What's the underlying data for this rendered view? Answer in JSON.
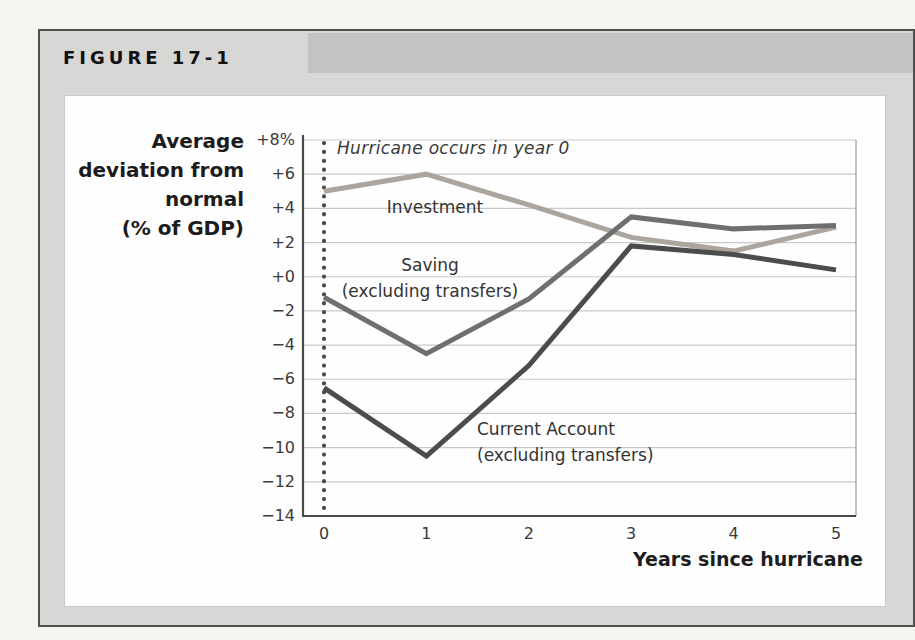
{
  "figure": {
    "label": "FIGURE 17-1"
  },
  "chart_data": {
    "type": "line",
    "x": [
      0,
      1,
      2,
      3,
      4,
      5
    ],
    "xlabel": "Years since hurricane",
    "ylabel_lines": [
      "Average",
      "deviation from",
      "normal",
      "(% of GDP)"
    ],
    "ylim": [
      -14,
      8
    ],
    "ytick_step": 2,
    "ytick_labels": [
      "+8%",
      "+6",
      "+4",
      "+2",
      "+0",
      "−2",
      "−4",
      "−6",
      "−8",
      "−10",
      "−12",
      "−14"
    ],
    "xtick_labels": [
      "0",
      "1",
      "2",
      "3",
      "4",
      "5"
    ],
    "annotation": "Hurricane occurs in year 0",
    "event_line_x": 0,
    "grid": true,
    "legend_position": "inline-labels",
    "series": [
      {
        "name": "Investment",
        "label_lines": [
          "Investment"
        ],
        "values": [
          5.0,
          6.0,
          4.2,
          2.3,
          1.5,
          2.9
        ],
        "color": "#aba59e"
      },
      {
        "name": "Saving (excluding transfers)",
        "label_lines": [
          "Saving",
          "(excluding transfers)"
        ],
        "values": [
          -1.2,
          -4.5,
          -1.3,
          3.5,
          2.8,
          3.0
        ],
        "color": "#6f6f6f"
      },
      {
        "name": "Current Account (excluding transfers)",
        "label_lines": [
          "Current Account",
          "(excluding transfers)"
        ],
        "values": [
          -6.5,
          -10.5,
          -5.2,
          1.8,
          1.3,
          0.4
        ],
        "color": "#4c4c4c"
      }
    ],
    "colors": {
      "grid": "#c9c9c9",
      "axis": "#4a4a4a",
      "plot_right_edge": "#9a9a9a",
      "event_dots": "#4a4a4a"
    }
  }
}
